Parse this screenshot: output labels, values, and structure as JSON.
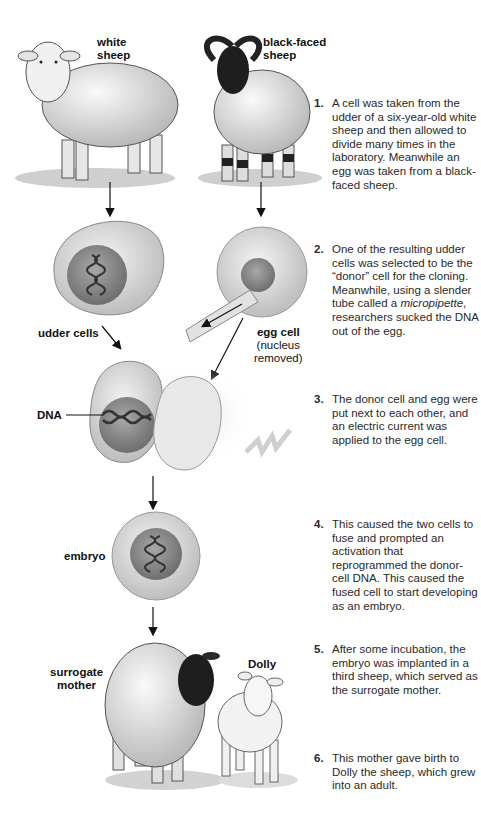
{
  "figure": {
    "labels": {
      "white_sheep": [
        "white",
        "sheep"
      ],
      "black_faced_sheep": [
        "black-faced",
        "sheep"
      ],
      "udder_cells": "udder cells",
      "egg_cell": "egg cell",
      "egg_cell_note": [
        "(nucleus",
        "removed)"
      ],
      "dna": "DNA",
      "embryo": "embryo",
      "surrogate_mother": [
        "surrogate",
        "mother"
      ],
      "dolly": "Dolly"
    },
    "steps": [
      {
        "num": "1.",
        "text": "A cell was taken from the udder of a six-year-old white sheep and then allowed to divide many times in the laboratory. Meanwhile an egg was taken from a black-faced sheep."
      },
      {
        "num": "2.",
        "text_before": "One of the resulting udder cells was selected to be the “donor” cell for the cloning. Meanwhile, using a slender tube called a ",
        "italic": "micropipette",
        "text_after": ", researchers sucked the DNA out of the egg."
      },
      {
        "num": "3.",
        "text": "The donor cell and egg were put next to each other, and an electric current was applied to the egg cell."
      },
      {
        "num": "4.",
        "text": "This caused the two cells to fuse and prompted an activation that reprogrammed the donor-cell DNA. This caused the fused cell to start developing as an embryo."
      },
      {
        "num": "5.",
        "text": "After some incubation, the embryo was implanted in a third sheep, which served as the surrogate mother."
      },
      {
        "num": "6.",
        "text": "This mother gave birth to Dolly the sheep, which grew into an adult."
      }
    ]
  }
}
